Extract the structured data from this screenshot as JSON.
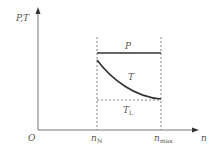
{
  "diagram": {
    "y_axis_label": "P,T",
    "x_axis_label": "n",
    "origin_label": "O",
    "x_ticks": [
      {
        "main": "n",
        "sub": "N"
      },
      {
        "main": "n",
        "sub": "max"
      }
    ],
    "curves": {
      "power": {
        "label": "P"
      },
      "torque": {
        "label": "T"
      },
      "torque_limit": {
        "label": "T",
        "sub": "L"
      }
    },
    "colors": {
      "axis": "#777777",
      "curve": "#333333",
      "dashed": "#666666",
      "text": "#555555"
    }
  }
}
